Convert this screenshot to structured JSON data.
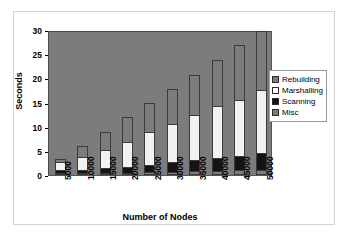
{
  "chart_data": {
    "type": "bar",
    "subtype": "stacked-bar",
    "title": "",
    "subtitle": "",
    "xlabel": "Number of Nodes",
    "ylabel": "Seconds",
    "categories": [
      "5000",
      "10000",
      "15000",
      "20000",
      "25000",
      "30000",
      "35000",
      "40000",
      "45000",
      "50000"
    ],
    "ylim": [
      0,
      30
    ],
    "yticks": [
      0,
      5,
      10,
      15,
      20,
      25,
      30
    ],
    "grid": false,
    "legend_position": "right",
    "plot_background": "#7c7c7c",
    "series": [
      {
        "name": "Misc",
        "color": "#7c7c7c",
        "values": [
          0.3,
          0.4,
          0.5,
          0.5,
          0.6,
          0.7,
          0.8,
          0.9,
          1.0,
          1.1
        ]
      },
      {
        "name": "Scanning",
        "color": "#141414",
        "values": [
          0.7,
          0.7,
          0.9,
          1.1,
          1.5,
          1.9,
          2.3,
          2.7,
          3.0,
          3.4
        ]
      },
      {
        "name": "Marshalling",
        "color": "#f2f2f2",
        "values": [
          1.5,
          2.7,
          3.8,
          5.3,
          6.7,
          7.9,
          9.4,
          10.7,
          11.6,
          13.1
        ]
      },
      {
        "name": "Rebuilding",
        "color": "#7c7c7c",
        "values": [
          0.6,
          2.2,
          3.8,
          5.1,
          6.2,
          7.3,
          8.3,
          9.6,
          11.3,
          12.3
        ]
      }
    ],
    "totals": [
      3.1,
      6.0,
      9.0,
      12.0,
      15.0,
      17.8,
      20.8,
      23.9,
      26.9,
      29.9
    ]
  },
  "legend": {
    "items": [
      {
        "label": "Rebuilding",
        "color": "#7c7c7c",
        "swatch": "legend-swatch-rebuilding"
      },
      {
        "label": "Marshalling",
        "color": "#ffffff",
        "swatch": "legend-swatch-marshalling"
      },
      {
        "label": "Scanning",
        "color": "#141414",
        "swatch": "legend-swatch-scanning"
      },
      {
        "label": "Misc",
        "color": "#7c7c7c",
        "swatch": "legend-swatch-misc"
      }
    ]
  }
}
